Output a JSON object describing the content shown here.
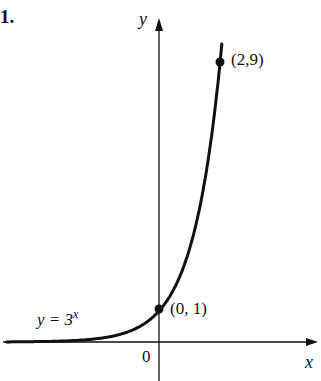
{
  "problem_number": "1.",
  "chart_data": {
    "type": "line",
    "title": "",
    "function": "y = 3^x",
    "curve_label": "y = 3",
    "curve_label_exponent": "x",
    "xlabel": "x",
    "ylabel": "y",
    "origin_label": "0",
    "x": [
      -5,
      -3,
      -2,
      -1,
      0,
      1,
      2,
      2.1
    ],
    "y": [
      0.004,
      0.037,
      0.111,
      0.333,
      1,
      3,
      9,
      10.0
    ],
    "marked_points": [
      {
        "x": 0,
        "y": 1,
        "label": "(0, 1)"
      },
      {
        "x": 2,
        "y": 9,
        "label": "(2,9)"
      }
    ],
    "grid": false,
    "legend": null
  },
  "colors": {
    "ink": "#111111",
    "background": "#ffffff"
  }
}
